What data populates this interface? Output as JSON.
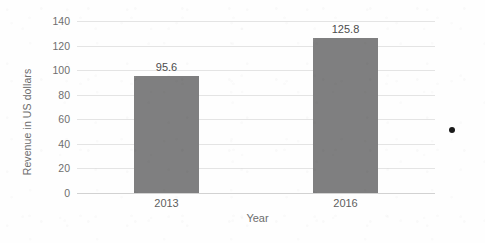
{
  "chart_data": {
    "type": "bar",
    "title": "",
    "subtitle": "",
    "xlabel": "Year",
    "ylabel": "Revenue in US dollars",
    "categories": [
      "2013",
      "2016"
    ],
    "values": [
      95.6,
      125.8
    ],
    "data_labels": [
      "95.6",
      "125.8"
    ],
    "series": [
      {
        "name": "Revenue",
        "values": [
          95.6,
          125.8
        ],
        "color": "#7f7f80"
      }
    ],
    "ylim": [
      0,
      140
    ],
    "ytick_step": 20,
    "ytick_labels": [
      "140",
      "120",
      "100",
      "80",
      "60",
      "40",
      "20",
      "0"
    ],
    "ytick_values": [
      140,
      120,
      100,
      80,
      60,
      40,
      20,
      0
    ],
    "grid": true,
    "grid_axis": "y",
    "legend": false,
    "legend_position": "none",
    "annotations": []
  },
  "colors": {
    "bar": "#7f7f80",
    "gridline": "#e4e4e4",
    "baseline": "#d2d2d2",
    "tick_text": "#6f6f6f",
    "axis_title_text": "#6d6d6d",
    "value_label_text": "#4c4c4c",
    "background": "#fefefe"
  },
  "artifacts": {
    "scan_dot": "scan-artifact-dot"
  }
}
